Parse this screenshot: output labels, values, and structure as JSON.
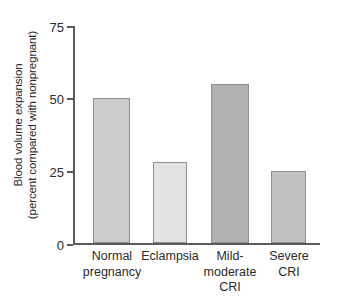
{
  "chart_data": {
    "type": "bar",
    "title": "",
    "xlabel": "",
    "ylabel": "Blood volume expansion (percent compared with nonpregnant)",
    "ylabel_lines": [
      "Blood volume expansion",
      "(percent compared with nonpregnant)"
    ],
    "categories": [
      "Normal pregnancy",
      "Eclampsia",
      "Mild-moderate CRI",
      "Severe CRI"
    ],
    "category_lines": [
      [
        "Normal",
        "pregnancy"
      ],
      [
        "Eclampsia"
      ],
      [
        "Mild-",
        "moderate",
        "CRI"
      ],
      [
        "Severe",
        "CRI"
      ]
    ],
    "values": [
      50,
      28,
      55,
      25
    ],
    "ylim": [
      0,
      75
    ],
    "yticks": [
      0,
      25,
      50,
      75
    ],
    "ytick_labels": [
      "0",
      "25",
      "50",
      "75"
    ],
    "grid": false,
    "legend": false,
    "bar_colors": [
      "#cdcdcd",
      "#e2e2e2",
      "#b2b2b2",
      "#c2c2c2"
    ],
    "bar_edge_color": "#8e8e8e",
    "axis_color": "#5b5b5b",
    "background": "#ffffff"
  }
}
